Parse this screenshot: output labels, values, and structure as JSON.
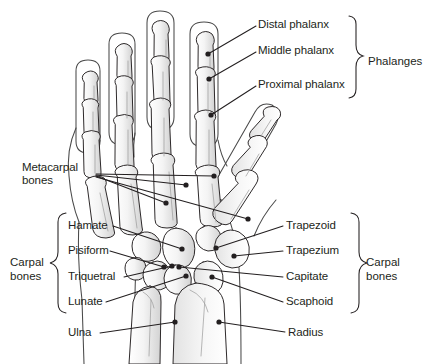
{
  "figure": {
    "view": "dorsal view of left hand skeleton with forearm",
    "colors": {
      "outline": "#231f20",
      "bone_fill": "#efefef",
      "bone_shadow": "#d9d9d9",
      "background": "#ffffff",
      "leader_line": "#231f20",
      "text": "#231f20"
    }
  },
  "labels": {
    "distal_phalanx": "Distal phalanx",
    "middle_phalanx": "Middle phalanx",
    "proximal_phalanx": "Proximal phalanx",
    "metacarpal_bones": "Metacarpal\nbones",
    "hamate": "Hamate",
    "pisiform": "Pisiform",
    "triquetral": "Triquetral",
    "lunate": "Lunate",
    "ulna": "Ulna",
    "trapezoid": "Trapezoid",
    "trapezium": "Trapezium",
    "capitate": "Capitate",
    "scaphoid": "Scaphoid",
    "radius": "Radius"
  },
  "groups": {
    "phalanges": "Phalanges",
    "carpal_bones_left": "Carpal\nbones",
    "carpal_bones_right": "Carpal\nbones"
  },
  "annotations": {
    "metacarpal_count": 4,
    "carpal_labelled_count": 8,
    "phalanx_labelled_count": 3
  }
}
